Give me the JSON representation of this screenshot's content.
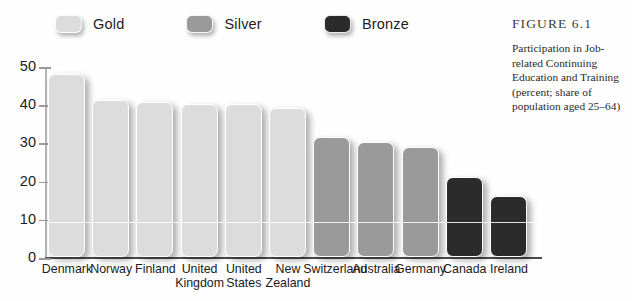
{
  "caption": {
    "title": "FIGURE 6.1",
    "body": "Participation in Job-related Continuing Education and Training (percent; share of population aged 25–64)"
  },
  "legend": {
    "items": [
      {
        "label": "Gold",
        "color": "#dcdcdc"
      },
      {
        "label": "Silver",
        "color": "#9a9a9a"
      },
      {
        "label": "Bronze",
        "color": "#2b2b2b"
      }
    ]
  },
  "chart_data": {
    "type": "bar",
    "title": "Participation in Job-related Continuing Education and Training",
    "xlabel": "",
    "ylabel": "",
    "ylim": [
      0,
      50
    ],
    "yticks": [
      0,
      10,
      20,
      30,
      40,
      50
    ],
    "ytick_labels": [
      "0",
      "10",
      "20",
      "30",
      "40",
      "50"
    ],
    "grid": false,
    "legend_position": "top-left",
    "categories": [
      "Denmark",
      "Norway",
      "Finland",
      "United Kingdom",
      "United States",
      "New Zealand",
      "Switzerland",
      "Australia",
      "Germany",
      "Canada",
      "Ireland"
    ],
    "category_lines": [
      [
        "Denmark"
      ],
      [
        "Norway"
      ],
      [
        "Finland"
      ],
      [
        "United",
        "Kingdom"
      ],
      [
        "United",
        "States"
      ],
      [
        "New",
        "Zealand"
      ],
      [
        "Switzerland"
      ],
      [
        "Australia"
      ],
      [
        "Germany"
      ],
      [
        "Canada"
      ],
      [
        "Ireland"
      ]
    ],
    "values": [
      48,
      41,
      40.5,
      40,
      40,
      39,
      31.5,
      30,
      28.7,
      21,
      16
    ],
    "bar_groups": [
      "Gold",
      "Gold",
      "Gold",
      "Gold",
      "Gold",
      "Gold",
      "Silver",
      "Silver",
      "Silver",
      "Bronze",
      "Bronze"
    ],
    "bar_colors": [
      "#dcdcdc",
      "#dcdcdc",
      "#dcdcdc",
      "#dcdcdc",
      "#dcdcdc",
      "#dcdcdc",
      "#9a9a9a",
      "#9a9a9a",
      "#9a9a9a",
      "#2b2b2b",
      "#2b2b2b"
    ]
  }
}
